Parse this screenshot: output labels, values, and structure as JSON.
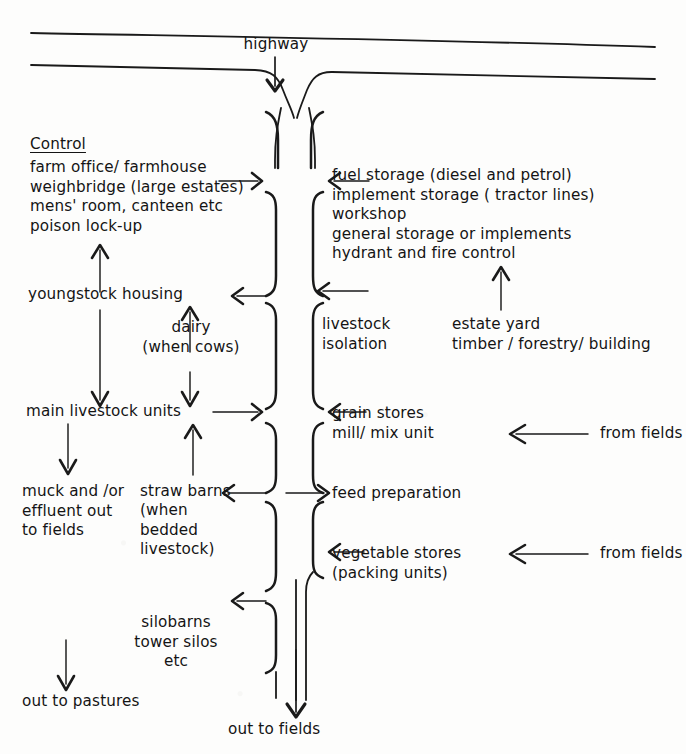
{
  "diagram": {
    "type": "flow-diagram",
    "background_color": "#fdfdfc",
    "ink_color": "#141414"
  },
  "top": {
    "highway_label": "highway"
  },
  "left_column": {
    "control_heading": "Control",
    "control_items": "farm office/ farmhouse\nweighbridge (large estates)\nmens' room, canteen etc\npoison lock-up",
    "youngstock": "youngstock housing",
    "dairy": "dairy\n(when cows)",
    "main_livestock": "main livestock units",
    "muck": "muck and /or\neffluent out\nto fields",
    "straw_barns": "straw barns",
    "straw_barns_note": "(when\nbedded\nlivestock)",
    "silos": "silobarns\ntower silos\netc",
    "out_to_pastures": "out to pastures"
  },
  "right_column": {
    "storage_items": "fuel storage (diesel and petrol)\nimplement storage ( tractor lines)\nworkshop\ngeneral storage or implements\nhydrant and fire control",
    "livestock_isolation": "livestock\nisolation",
    "estate_yard": "estate yard\ntimber / forestry/ building",
    "grain_stores": "grain stores\nmill/ mix unit",
    "feed_preparation": "feed preparation",
    "vegetable_stores": "vegetable stores\n(packing units)",
    "from_fields_upper": "from fields",
    "from_fields_lower": "from fields"
  },
  "bottom": {
    "out_to_fields": "out to fields"
  },
  "icons": {
    "arrow_down": "arrow-down-icon",
    "arrow_up": "arrow-up-icon",
    "arrow_left": "arrow-left-icon",
    "arrow_right": "arrow-right-icon",
    "bracket_left": "bracket-left-icon",
    "bracket_right": "bracket-right-icon",
    "road_line": "road-line-icon"
  }
}
